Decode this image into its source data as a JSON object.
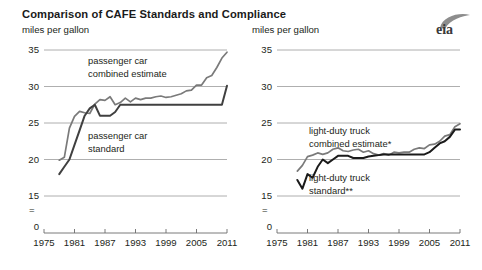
{
  "title": "Comparison of CAFE Standards and Compliance",
  "logo": {
    "name": "eia-logo",
    "text": "eia"
  },
  "chart_data": [
    {
      "type": "line",
      "panel": "left",
      "title": "Comparison of CAFE Standards and Compliance",
      "ylabel": "miles per gallon",
      "xlabel": "",
      "ylim": [
        15,
        35
      ],
      "yticks": [
        "15",
        "20",
        "25",
        "30",
        "35"
      ],
      "axis_break_label": "=",
      "zero_label": "0",
      "xlim": [
        1975,
        2011
      ],
      "xticks": [
        "1975",
        "1981",
        "1987",
        "1993",
        "1999",
        "2005",
        "2011"
      ],
      "grid": true,
      "legend_position": "inline-annotation",
      "annotations": [
        {
          "name": "passenger-car-combined-estimate",
          "text_line1": "passenger car",
          "text_line2": "combined estimate"
        },
        {
          "name": "passenger-car-standard",
          "text_line1": "passenger car",
          "text_line2": "standard"
        }
      ],
      "series": [
        {
          "name": "passenger car combined estimate",
          "color": "#7a7a7a",
          "x": [
            1978,
            1979,
            1980,
            1981,
            1982,
            1983,
            1984,
            1985,
            1986,
            1987,
            1988,
            1989,
            1990,
            1991,
            1992,
            1993,
            1994,
            1995,
            1996,
            1997,
            1998,
            1999,
            2000,
            2001,
            2002,
            2003,
            2004,
            2005,
            2006,
            2007,
            2008,
            2009,
            2010,
            2011
          ],
          "values": [
            19.9,
            20.3,
            24.3,
            25.9,
            26.6,
            26.4,
            26.3,
            27.6,
            28.2,
            28.1,
            28.6,
            27.5,
            27.8,
            28.4,
            27.9,
            28.4,
            28.2,
            28.4,
            28.4,
            28.6,
            28.7,
            28.5,
            28.6,
            28.8,
            29.0,
            29.4,
            29.5,
            30.2,
            30.2,
            31.2,
            31.5,
            32.6,
            33.9,
            34.7
          ]
        },
        {
          "name": "passenger car standard",
          "color": "#404040",
          "x": [
            1978,
            1979,
            1980,
            1981,
            1982,
            1983,
            1984,
            1985,
            1986,
            1987,
            1988,
            1989,
            1990,
            1991,
            1992,
            1993,
            1994,
            1995,
            1996,
            1997,
            1998,
            1999,
            2000,
            2001,
            2002,
            2003,
            2004,
            2005,
            2006,
            2007,
            2008,
            2009,
            2010,
            2011
          ],
          "values": [
            18.0,
            19.0,
            20.0,
            22.0,
            24.0,
            26.0,
            27.0,
            27.5,
            26.0,
            26.0,
            26.0,
            26.5,
            27.5,
            27.5,
            27.5,
            27.5,
            27.5,
            27.5,
            27.5,
            27.5,
            27.5,
            27.5,
            27.5,
            27.5,
            27.5,
            27.5,
            27.5,
            27.5,
            27.5,
            27.5,
            27.5,
            27.5,
            27.5,
            30.1
          ]
        }
      ]
    },
    {
      "type": "line",
      "panel": "right",
      "ylabel": "miles per gallon",
      "xlabel": "",
      "ylim": [
        15,
        35
      ],
      "yticks": [
        "15",
        "20",
        "25",
        "30",
        "35"
      ],
      "axis_break_label": "=",
      "zero_label": "0",
      "xlim": [
        1975,
        2011
      ],
      "xticks": [
        "1975",
        "1981",
        "1987",
        "1993",
        "1999",
        "2005",
        "2011"
      ],
      "grid": true,
      "legend_position": "inline-annotation",
      "annotations": [
        {
          "name": "light-duty-truck-combined-estimate",
          "text_line1": "light-duty truck",
          "text_line2": "combined estimate*"
        },
        {
          "name": "light-duty-truck-standard",
          "text_line1": "light-duty truck",
          "text_line2": "standard**"
        }
      ],
      "series": [
        {
          "name": "light-duty truck combined estimate*",
          "color": "#7a7a7a",
          "x": [
            1979,
            1980,
            1981,
            1982,
            1983,
            1984,
            1985,
            1986,
            1987,
            1988,
            1989,
            1990,
            1991,
            1992,
            1993,
            1994,
            1995,
            1996,
            1997,
            1998,
            1999,
            2000,
            2001,
            2002,
            2003,
            2004,
            2005,
            2006,
            2007,
            2008,
            2009,
            2010,
            2011
          ],
          "values": [
            18.4,
            19.2,
            20.4,
            20.6,
            20.9,
            20.7,
            20.9,
            21.4,
            21.6,
            21.2,
            21.1,
            21.3,
            21.4,
            21.0,
            21.2,
            20.8,
            20.6,
            20.8,
            20.6,
            21.0,
            20.9,
            21.0,
            21.0,
            21.4,
            21.6,
            21.5,
            22.0,
            22.1,
            22.5,
            23.2,
            23.4,
            24.5,
            24.9
          ]
        },
        {
          "name": "light-duty truck standard**",
          "color": "#1a1a1a",
          "x": [
            1979,
            1980,
            1981,
            1982,
            1983,
            1984,
            1985,
            1986,
            1987,
            1988,
            1989,
            1990,
            1991,
            1992,
            1993,
            1994,
            1995,
            1996,
            1997,
            1998,
            1999,
            2000,
            2001,
            2002,
            2003,
            2004,
            2005,
            2006,
            2007,
            2008,
            2009,
            2010,
            2011
          ],
          "values": [
            17.2,
            16.0,
            18.0,
            17.5,
            19.0,
            20.0,
            19.5,
            20.0,
            20.5,
            20.5,
            20.5,
            20.2,
            20.2,
            20.2,
            20.4,
            20.5,
            20.6,
            20.7,
            20.7,
            20.7,
            20.7,
            20.7,
            20.7,
            20.7,
            20.7,
            20.7,
            21.0,
            21.6,
            22.2,
            22.5,
            23.1,
            24.1,
            24.1
          ]
        }
      ]
    }
  ]
}
